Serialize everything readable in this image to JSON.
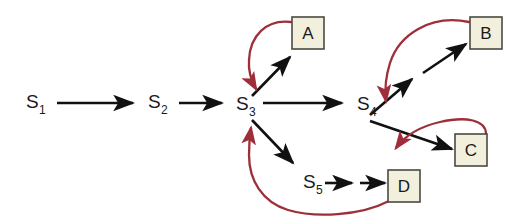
{
  "diagram": {
    "type": "state-transition-pathway",
    "background_color": "#ffffff",
    "forward_arrow_color": "#111111",
    "feedback_arrow_color": "#9e2f3a",
    "box_fill_color": "#f2efdc",
    "box_border_color": "#4a4a42",
    "states": [
      {
        "id": "S1",
        "base": "S",
        "sub": "1",
        "x": 26,
        "y": 108
      },
      {
        "id": "S2",
        "base": "S",
        "sub": "2",
        "x": 148,
        "y": 108
      },
      {
        "id": "S3",
        "base": "S",
        "sub": "3",
        "x": 236,
        "y": 110
      },
      {
        "id": "S4",
        "base": "S",
        "sub": "4",
        "x": 357,
        "y": 110
      },
      {
        "id": "S5",
        "base": "S",
        "sub": "5",
        "x": 303,
        "y": 188
      }
    ],
    "boxes": [
      {
        "id": "A",
        "label": "A",
        "x": 292,
        "y": 17,
        "w": 32,
        "h": 32
      },
      {
        "id": "B",
        "label": "B",
        "x": 470,
        "y": 17,
        "w": 32,
        "h": 32
      },
      {
        "id": "C",
        "label": "C",
        "x": 455,
        "y": 134,
        "w": 32,
        "h": 32
      },
      {
        "id": "D",
        "label": "D",
        "x": 388,
        "y": 170,
        "w": 32,
        "h": 32
      }
    ],
    "forward_transitions": [
      {
        "from": "S1",
        "to": "S2"
      },
      {
        "from": "S2",
        "to": "S3"
      },
      {
        "from": "S3",
        "to": "A"
      },
      {
        "from": "S3",
        "to": "S4"
      },
      {
        "from": "S3",
        "to": "S5"
      },
      {
        "from": "S4",
        "to": "B"
      },
      {
        "from": "S4",
        "to": "C"
      },
      {
        "from": "S5",
        "to": "D"
      }
    ],
    "feedback_transitions": [
      {
        "from": "A",
        "to": "S3"
      },
      {
        "from": "B",
        "to": "S4"
      },
      {
        "from": "C",
        "to": "S4"
      },
      {
        "from": "D",
        "to": "S3"
      }
    ]
  }
}
